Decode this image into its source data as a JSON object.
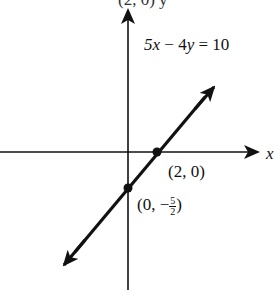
{
  "figure": {
    "top_cutoff_text": "(2, 0)   y",
    "equation": "5x − 4y = 10",
    "x_axis_label": "x",
    "points": [
      {
        "label_prefix": "(2, 0)",
        "x": 2,
        "y": 0
      },
      {
        "label_prefix": "(0, −",
        "frac_num": "5",
        "frac_den": "2",
        "label_suffix": ")",
        "x": 0,
        "y": -2.5
      }
    ],
    "colors": {
      "line": "#111111",
      "background": "#ffffff"
    }
  }
}
